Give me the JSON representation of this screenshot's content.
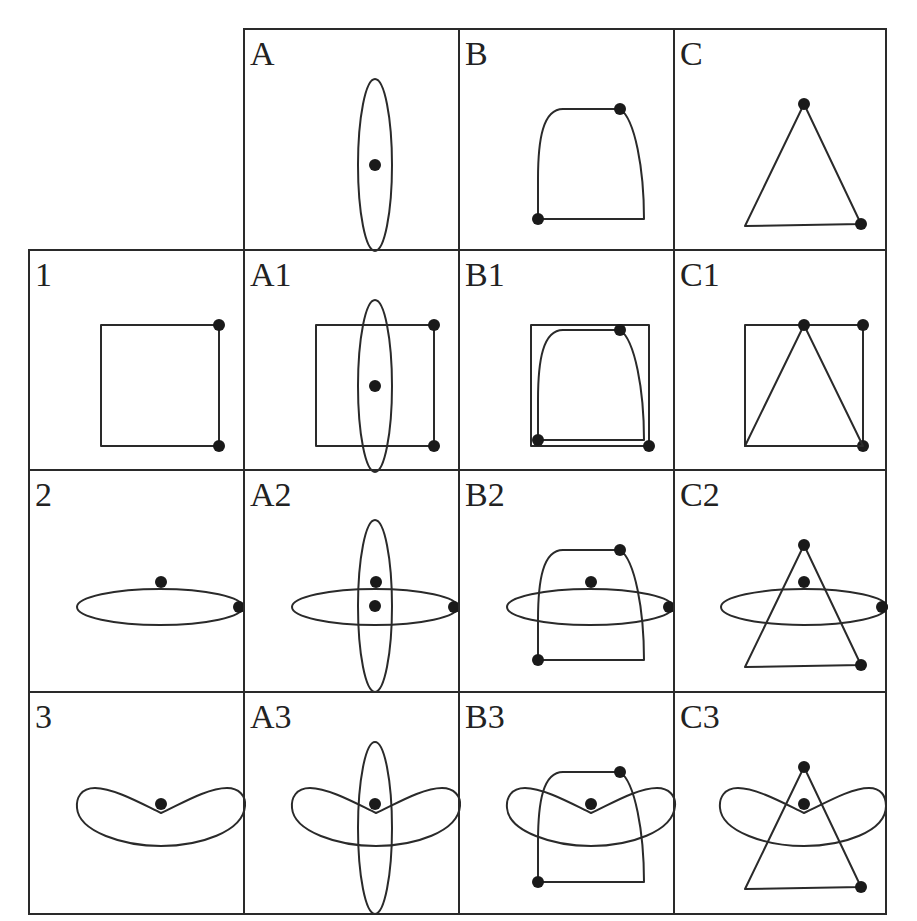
{
  "diagram": {
    "title": "",
    "grid": {
      "col_x": [
        29,
        244,
        459,
        674,
        886
      ],
      "row_y": [
        29,
        250,
        470,
        692,
        914
      ],
      "border_color": "#2a2a2a",
      "dot_color": "#1a1a1a"
    },
    "column_headers": [
      {
        "id": "A",
        "label": "A",
        "shape": "vertical-ellipse"
      },
      {
        "id": "B",
        "label": "B",
        "shape": "rounded-top-quad"
      },
      {
        "id": "C",
        "label": "C",
        "shape": "triangle"
      }
    ],
    "row_headers": [
      {
        "id": "1",
        "label": "1",
        "shape": "square"
      },
      {
        "id": "2",
        "label": "2",
        "shape": "horizontal-ellipse"
      },
      {
        "id": "3",
        "label": "3",
        "shape": "boomerang"
      }
    ],
    "cells": {
      "A": "A",
      "B": "B",
      "C": "C",
      "r1": "1",
      "A1": "A1",
      "B1": "B1",
      "C1": "C1",
      "r2": "2",
      "A2": "A2",
      "B2": "B2",
      "C2": "C2",
      "r3": "3",
      "A3": "A3",
      "B3": "B3",
      "C3": "C3"
    },
    "shapes": {
      "A": {
        "type": "ellipse",
        "cx": 131,
        "cy": 136,
        "rx": 17,
        "ry": 86,
        "dots": [
          [
            131,
            136
          ]
        ]
      },
      "B": {
        "type": "path",
        "d": "M79,190 L79,150 C79,110 84,80 104,80 L161,80 C176,90 185,140 185,190 Z",
        "dots": [
          [
            79,
            190
          ],
          [
            161,
            80
          ]
        ]
      },
      "C": {
        "type": "polygon",
        "points": "130,75 71,197 187,195",
        "dots": [
          [
            130,
            75
          ],
          [
            187,
            195
          ]
        ]
      },
      "1": {
        "type": "rect",
        "x": 72,
        "y": 75,
        "w": 118,
        "h": 121,
        "dots": [
          [
            190,
            75
          ],
          [
            190,
            196
          ]
        ]
      },
      "2": {
        "type": "ellipse",
        "cx": 131,
        "cy": 137,
        "rx": 83,
        "ry": 18,
        "dots": [
          [
            132,
            112
          ],
          [
            211,
            137
          ]
        ]
      },
      "3": {
        "type": "path",
        "d": "M132,121 C115,113 85,96 66,96 C52,96 47,106 48,116 C50,140 95,154 132,154 C170,154 214,140 216,114 C217,104 210,96 198,96 C178,96 150,113 132,121 Z",
        "dots": [
          [
            132,
            112
          ]
        ]
      }
    }
  }
}
